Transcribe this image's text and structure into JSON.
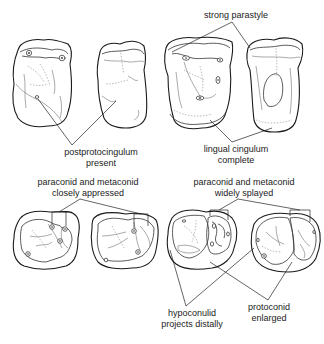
{
  "figure": {
    "panels": {
      "upper_left": {
        "label_line1": "postprotocingulum",
        "label_line2": "present"
      },
      "upper_right": {
        "top_label": "strong parastyle",
        "bottom_label_line1": "lingual cingulum",
        "bottom_label_line2": "complete"
      },
      "lower_left": {
        "label_line1": "paraconid and metaconid",
        "label_line2": "closely appressed"
      },
      "lower_right": {
        "top_label_line1": "paraconid and metaconid",
        "top_label_line2": "widely splayed",
        "bottom_left_label_line1": "hypoconulid",
        "bottom_left_label_line2": "projects distally",
        "bottom_right_label_line1": "protoconid",
        "bottom_right_label_line2": "enlarged"
      }
    },
    "colors": {
      "line": "#1a1a1a",
      "background": "#ffffff"
    }
  }
}
